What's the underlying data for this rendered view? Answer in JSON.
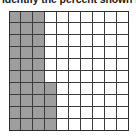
{
  "caption": {
    "text": "identify the percent shown in"
  },
  "colors": {
    "shaded_fill": "#9e9e9e",
    "unshaded_fill": "#ffffff",
    "grid_line": "#3c3c3c",
    "grid_outer_border": "#2d2d2d",
    "text": "#1a1a1a",
    "background": "#ffffff"
  },
  "chart_data": {
    "type": "heatmap",
    "title": "",
    "subtitle": "",
    "xlabel": "",
    "ylabel": "",
    "rows": 10,
    "columns": 10,
    "total_cells": 100,
    "shaded_cells": 34,
    "unshaded_cells": 66,
    "percent_shaded": 34,
    "percent_unshaded": 66,
    "fraction_shaded": "34/100",
    "decimal_shaded": 0.34,
    "legend": [
      {
        "label": "shaded",
        "value": 34,
        "color": "#9e9e9e"
      },
      {
        "label": "unshaded",
        "value": 66,
        "color": "#ffffff"
      }
    ],
    "shaded_per_row": [
      3,
      3,
      3,
      3,
      3,
      3,
      4,
      4,
      4,
      4
    ],
    "grid": [
      [
        1,
        1,
        1,
        0,
        0,
        0,
        0,
        0,
        0,
        0
      ],
      [
        1,
        1,
        1,
        0,
        0,
        0,
        0,
        0,
        0,
        0
      ],
      [
        1,
        1,
        1,
        0,
        0,
        0,
        0,
        0,
        0,
        0
      ],
      [
        1,
        1,
        1,
        0,
        0,
        0,
        0,
        0,
        0,
        0
      ],
      [
        1,
        1,
        1,
        0,
        0,
        0,
        0,
        0,
        0,
        0
      ],
      [
        1,
        1,
        1,
        0,
        0,
        0,
        0,
        0,
        0,
        0
      ],
      [
        1,
        1,
        1,
        1,
        0,
        0,
        0,
        0,
        0,
        0
      ],
      [
        1,
        1,
        1,
        1,
        0,
        0,
        0,
        0,
        0,
        0
      ],
      [
        1,
        1,
        1,
        1,
        0,
        0,
        0,
        0,
        0,
        0
      ],
      [
        1,
        1,
        1,
        1,
        0,
        0,
        0,
        0,
        0,
        0
      ]
    ],
    "grid_on": true,
    "legend_position": "none"
  }
}
